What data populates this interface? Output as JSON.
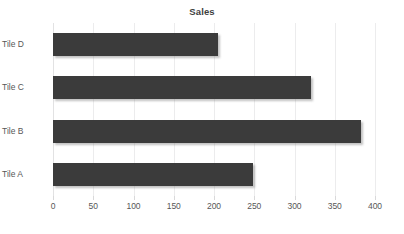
{
  "chart_data": {
    "type": "bar",
    "orientation": "horizontal",
    "title": "Sales",
    "xlabel": "",
    "ylabel": "",
    "categories": [
      "Tile A",
      "Tile B",
      "Tile C",
      "Tile D"
    ],
    "values": [
      248,
      382,
      320,
      205
    ],
    "series": [
      {
        "name": "Sales",
        "values": [
          248,
          382,
          320,
          205
        ]
      }
    ],
    "display_order_top_to_bottom": [
      "Tile D",
      "Tile C",
      "Tile B",
      "Tile A"
    ],
    "xlim": [
      0,
      400
    ],
    "xticks": [
      0,
      50,
      100,
      150,
      200,
      250,
      300,
      350,
      400
    ],
    "xtick_labels": [
      "0",
      "50",
      "100",
      "150",
      "200",
      "250",
      "300",
      "350",
      "400"
    ],
    "grid": true,
    "grid_axis": "x",
    "legend": false,
    "legend_position": "none",
    "bar_color": "#3b3b3b",
    "gridline_color": "#ececed",
    "text_color": "#575757",
    "title_color": "#3f3f3f",
    "background_color": "#ffffff"
  },
  "axis": {
    "x_tick_labels": [
      "0",
      "50",
      "100",
      "150",
      "200",
      "250",
      "300",
      "350",
      "400"
    ],
    "y_category_labels_top_to_bottom": [
      "Tile D",
      "Tile C",
      "Tile B",
      "Tile A"
    ]
  }
}
